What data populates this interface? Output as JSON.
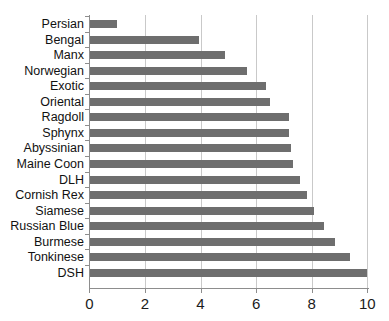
{
  "chart_data": {
    "type": "bar",
    "orientation": "horizontal",
    "title": "",
    "subtitle": "",
    "xlabel": "",
    "ylabel": "",
    "xlim": [
      0,
      10
    ],
    "ylim": null,
    "grid": "vertical",
    "legend": null,
    "bar_color": "#6e6e6e",
    "axis_color": "#8d8d8d",
    "gridline_color": "#c9c9c9",
    "xticks": [
      0,
      2,
      4,
      6,
      8,
      10
    ],
    "xtick_labels": [
      "0",
      "2",
      "4",
      "6",
      "8",
      "10"
    ],
    "categories": [
      "Persian",
      "Bengal",
      "Manx",
      "Norwegian",
      "Exotic",
      "Oriental",
      "Ragdoll",
      "Sphynx",
      "Abyssinian",
      "Maine Coon",
      "DLH",
      "Cornish Rex",
      "Siamese",
      "Russian Blue",
      "Burmese",
      "Tonkinese",
      "DSH"
    ],
    "values": [
      1.0,
      3.95,
      4.9,
      5.7,
      6.35,
      6.5,
      7.2,
      7.2,
      7.25,
      7.35,
      7.6,
      7.85,
      8.1,
      8.45,
      8.85,
      9.4,
      10.0
    ]
  }
}
